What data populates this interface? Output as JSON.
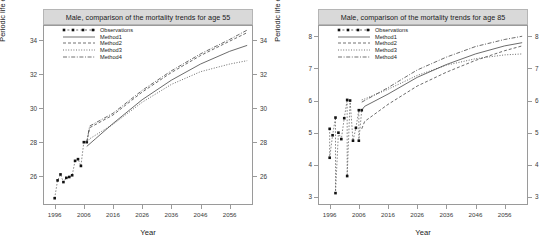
{
  "figure": {
    "background": "#ffffff",
    "title_band_color": "#d9d9d9",
    "frame_color": "#9a9a9a"
  },
  "panels": [
    {
      "id": "age-55",
      "title": "Male, comparison of the mortality trends for age 55",
      "xlabel": "Year",
      "ylabel": "Periodic life expectancies",
      "legend": [
        {
          "label": "Observations",
          "style": "points-dashed"
        },
        {
          "label": "Method1",
          "style": "solid"
        },
        {
          "label": "Method2",
          "style": "dashed"
        },
        {
          "label": "Method3",
          "style": "dotted"
        },
        {
          "label": "Method4",
          "style": "dotdash"
        }
      ],
      "yticks": [
        26,
        28,
        30,
        32,
        34
      ],
      "xticks": [
        1996,
        2006,
        2016,
        2026,
        2036,
        2046,
        2056
      ],
      "xlim": [
        1992,
        2064
      ],
      "ylim": [
        24.3,
        34.9
      ]
    },
    {
      "id": "age-85",
      "title": "Male, comparison of the mortality trends for age 85",
      "xlabel": "Year",
      "ylabel": "Periodic life expectancies",
      "legend": [
        {
          "label": "Observations",
          "style": "points-dashed"
        },
        {
          "label": "Method1",
          "style": "solid"
        },
        {
          "label": "Method2",
          "style": "dashed"
        },
        {
          "label": "Method3",
          "style": "dotted"
        },
        {
          "label": "Method4",
          "style": "dotdash"
        }
      ],
      "yticks": [
        3,
        4,
        5,
        6,
        7,
        8
      ],
      "xticks": [
        1996,
        2006,
        2016,
        2026,
        2036,
        2046,
        2056
      ],
      "xlim": [
        1992,
        2064
      ],
      "ylim": [
        2.75,
        8.35
      ]
    }
  ],
  "chart_data": [
    {
      "type": "line",
      "title": "Male, comparison of the mortality trends for age 55",
      "xlabel": "Year",
      "ylabel": "Periodic life expectancies",
      "xlim": [
        1992,
        2064
      ],
      "ylim": [
        24.3,
        34.9
      ],
      "xticks": [
        1996,
        2006,
        2016,
        2026,
        2036,
        2046,
        2056
      ],
      "yticks": [
        26,
        28,
        30,
        32,
        34
      ],
      "grid": false,
      "legend_position": "top-left",
      "observations": {
        "name": "Observations",
        "marker": "filled-square",
        "linestyle": "dashed",
        "x": [
          1996,
          1997,
          1998,
          1999,
          2000,
          2001,
          2002,
          2003,
          2004,
          2005,
          2006,
          2007
        ],
        "y": [
          24.7,
          25.75,
          26.1,
          25.65,
          25.9,
          25.95,
          26.05,
          26.9,
          27.0,
          26.6,
          28.0,
          28.0
        ]
      },
      "series": [
        {
          "name": "Method1",
          "linestyle": "solid",
          "x": [
            2007,
            2010,
            2016,
            2026,
            2036,
            2046,
            2056,
            2062
          ],
          "y": [
            27.75,
            28.2,
            29.1,
            30.5,
            31.65,
            32.6,
            33.35,
            33.7
          ]
        },
        {
          "name": "Method2",
          "linestyle": "dashed",
          "x": [
            2007,
            2008,
            2016,
            2026,
            2036,
            2046,
            2056,
            2062
          ],
          "y": [
            28.0,
            28.85,
            29.6,
            30.95,
            32.1,
            33.1,
            33.95,
            34.45
          ]
        },
        {
          "name": "Method3",
          "linestyle": "dotted",
          "x": [
            2007,
            2008,
            2016,
            2026,
            2036,
            2046,
            2056,
            2062
          ],
          "y": [
            28.0,
            28.2,
            29.05,
            30.35,
            31.4,
            32.15,
            32.6,
            32.8
          ]
        },
        {
          "name": "Method4",
          "linestyle": "dotdash",
          "x": [
            2007,
            2008,
            2016,
            2026,
            2036,
            2046,
            2056,
            2062
          ],
          "y": [
            28.0,
            28.95,
            29.7,
            31.05,
            32.2,
            33.2,
            34.05,
            34.6
          ]
        }
      ]
    },
    {
      "type": "line",
      "title": "Male, comparison of the mortality trends for age 85",
      "xlabel": "Year",
      "ylabel": "Periodic life expectancies",
      "xlim": [
        1992,
        2064
      ],
      "ylim": [
        2.75,
        8.35
      ],
      "xticks": [
        1996,
        2006,
        2016,
        2026,
        2036,
        2046,
        2056
      ],
      "yticks": [
        3,
        4,
        5,
        6,
        7,
        8
      ],
      "grid": false,
      "legend_position": "top-left",
      "observations": {
        "name": "Observations",
        "marker": "filled-square",
        "linestyle": "dashed",
        "x": [
          1996,
          1996,
          1997,
          1998,
          1998,
          1999,
          2000,
          2001,
          2002,
          2002,
          2003,
          2004,
          2005,
          2006,
          2006,
          2007
        ],
        "y": [
          5.12,
          4.22,
          4.92,
          5.47,
          3.12,
          5.0,
          4.8,
          5.45,
          6.02,
          3.65,
          6.0,
          4.75,
          5.15,
          5.7,
          4.75,
          5.7
        ]
      },
      "series": [
        {
          "name": "Method1",
          "linestyle": "solid",
          "x": [
            2007,
            2008,
            2016,
            2026,
            2036,
            2046,
            2056,
            2062
          ],
          "y": [
            5.7,
            5.82,
            6.2,
            6.72,
            7.12,
            7.45,
            7.7,
            7.8
          ]
        },
        {
          "name": "Method2",
          "linestyle": "dashed",
          "x": [
            2007,
            2008,
            2016,
            2026,
            2036,
            2046,
            2056,
            2062
          ],
          "y": [
            5.12,
            5.35,
            5.88,
            6.45,
            6.88,
            7.25,
            7.55,
            7.7
          ]
        },
        {
          "name": "Method3",
          "linestyle": "dotted",
          "x": [
            2007,
            2008,
            2016,
            2026,
            2036,
            2046,
            2056,
            2062
          ],
          "y": [
            6.02,
            6.05,
            6.35,
            6.78,
            7.1,
            7.3,
            7.42,
            7.45
          ]
        },
        {
          "name": "Method4",
          "linestyle": "dotdash",
          "x": [
            2007,
            2008,
            2016,
            2026,
            2036,
            2046,
            2056,
            2062
          ],
          "y": [
            5.95,
            6.0,
            6.4,
            6.95,
            7.35,
            7.68,
            7.9,
            8.0
          ]
        }
      ]
    }
  ]
}
